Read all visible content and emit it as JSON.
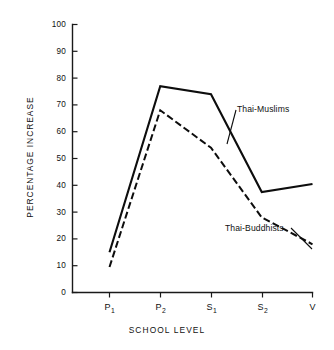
{
  "chart_data": {
    "type": "line",
    "title": "",
    "xlabel": "SCHOOL LEVEL",
    "ylabel": "PERCENTAGE INCREASE",
    "categories": [
      "P1",
      "P2",
      "S1",
      "S2",
      "V"
    ],
    "category_labels": [
      {
        "base": "P",
        "sub": "1"
      },
      {
        "base": "P",
        "sub": "2"
      },
      {
        "base": "S",
        "sub": "1"
      },
      {
        "base": "S",
        "sub": "2"
      },
      {
        "base": "V",
        "sub": ""
      }
    ],
    "ylim": [
      0,
      100
    ],
    "yticks": [
      0,
      10,
      20,
      30,
      40,
      50,
      60,
      70,
      80,
      90,
      100
    ],
    "ytick_labels": [
      "0",
      "10",
      "20",
      "30",
      "40",
      "50",
      "60",
      "70",
      "80",
      "90",
      "100"
    ],
    "grid": false,
    "legend_position": "inline-annotation",
    "series": [
      {
        "name": "Thai-Muslims",
        "style": "solid",
        "color": "#0d0d0d",
        "values": [
          15,
          77,
          74,
          37.5,
          40.5
        ]
      },
      {
        "name": "Thai-Buddhists",
        "style": "dashed",
        "color": "#0d0d0d",
        "values": [
          9.5,
          68,
          54,
          28,
          18
        ]
      }
    ],
    "annotations": [
      {
        "text": "Thai-Muslims",
        "series": "Thai-Muslims"
      },
      {
        "text": "Thai-Buddhists",
        "series": "Thai-Buddhists"
      }
    ]
  }
}
